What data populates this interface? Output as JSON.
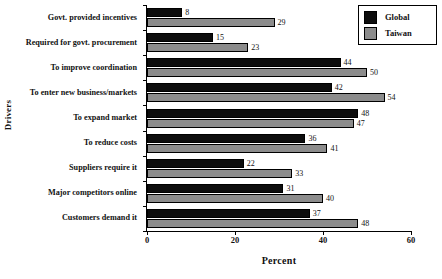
{
  "chart_data": {
    "type": "bar",
    "orientation": "horizontal",
    "title": "",
    "xlabel": "Percent",
    "ylabel": "Drivers",
    "xlim": [
      0,
      60
    ],
    "xticks": [
      0,
      20,
      40,
      60
    ],
    "grid": false,
    "legend_position": "top-right",
    "categories": [
      "Govt. provided incentives",
      "Required for govt. procurement",
      "To improve coordination",
      "To enter new business/markets",
      "To expand market",
      "To reduce costs",
      "Suppliers require it",
      "Major competitors online",
      "Customers demand it"
    ],
    "series": [
      {
        "name": "Global",
        "color": "#0d0d0d",
        "values": [
          8,
          15,
          44,
          42,
          48,
          36,
          22,
          31,
          37
        ]
      },
      {
        "name": "Taiwan",
        "color": "#8c8c8c",
        "values": [
          29,
          23,
          50,
          54,
          47,
          41,
          33,
          40,
          48
        ]
      }
    ]
  }
}
